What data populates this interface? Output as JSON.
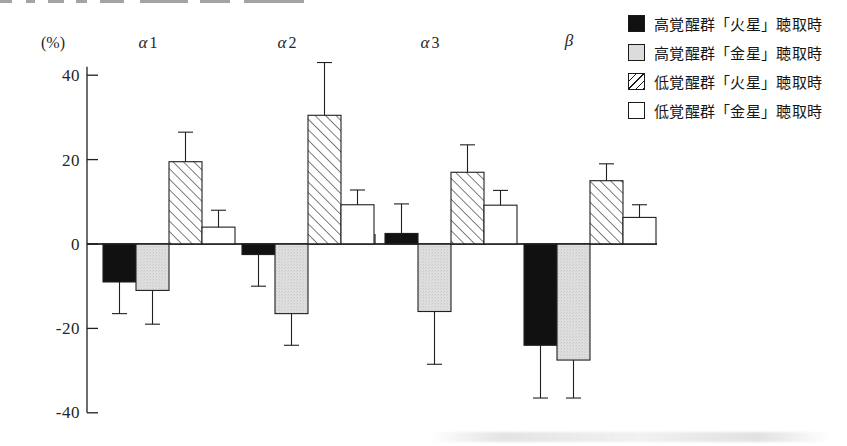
{
  "axis": {
    "unit_label": "(%)",
    "y_ticks": [
      "40",
      "20",
      "0",
      "-20",
      "-40"
    ],
    "y_tick_values": [
      40,
      20,
      0,
      -20,
      -40
    ]
  },
  "legend": {
    "items": [
      {
        "label": "高覚醒群「火星」聴取時",
        "pattern": "solid",
        "swatch_name": "legend-swatch-solid-black"
      },
      {
        "label": "高覚醒群「金星」聴取時",
        "pattern": "gray",
        "swatch_name": "legend-swatch-light-gray"
      },
      {
        "label": "低覚醒群「火星」聴取時",
        "pattern": "hatch",
        "swatch_name": "legend-swatch-diagonal-hatch"
      },
      {
        "label": "低覚醒群「金星」聴取時",
        "pattern": "white",
        "swatch_name": "legend-swatch-white"
      }
    ]
  },
  "chart_data": {
    "type": "bar",
    "title": "",
    "subtitle": "",
    "xlabel": "",
    "ylabel": "(%)",
    "ylim": [
      -40,
      45
    ],
    "grid": false,
    "legend_position": "top-right",
    "orientation": "vertical",
    "error_bars": "standard error (one-sided whiskers)",
    "categories": [
      "α1",
      "α2",
      "α3",
      "β"
    ],
    "category_labels": [
      {
        "greek": "α",
        "sub": "1"
      },
      {
        "greek": "α",
        "sub": "2"
      },
      {
        "greek": "α",
        "sub": "3"
      },
      {
        "greek": "β",
        "sub": ""
      }
    ],
    "series": [
      {
        "name": "高覚醒群「火星」聴取時",
        "pattern": "solid",
        "values": [
          -9.0,
          -2.5,
          2.5,
          -24.0
        ],
        "errors": [
          7.5,
          7.5,
          7.0,
          12.5
        ]
      },
      {
        "name": "高覚醒群「金星」聴取時",
        "pattern": "gray",
        "values": [
          -11.0,
          -16.5,
          -16.0,
          -27.5
        ],
        "errors": [
          8.0,
          7.5,
          12.5,
          9.0
        ]
      },
      {
        "name": "低覚醒群「火星」聴取時",
        "pattern": "hatch",
        "values": [
          19.5,
          30.5,
          17.0,
          15.0
        ],
        "errors": [
          7.0,
          12.5,
          6.5,
          4.0
        ]
      },
      {
        "name": "低覚醒群「金星」聴取時",
        "pattern": "white",
        "values": [
          4.0,
          9.3,
          9.2,
          6.3
        ],
        "errors": [
          4.0,
          3.5,
          3.5,
          3.0
        ]
      }
    ]
  }
}
